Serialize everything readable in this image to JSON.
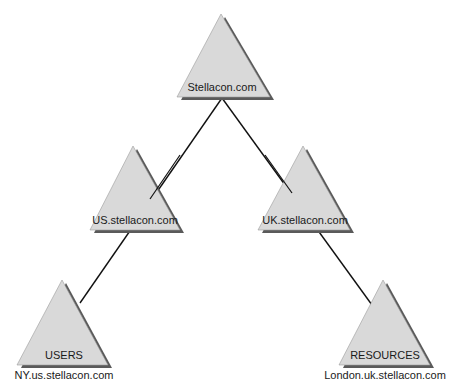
{
  "diagram": {
    "type": "domain-tree",
    "colors": {
      "triangle_fill": "#d9d9d9",
      "shadow": "#5a5a5a",
      "line": "#111111"
    },
    "nodes": [
      {
        "id": "root",
        "label": "Stellacon.com"
      },
      {
        "id": "us",
        "label": "US.stellacon.com"
      },
      {
        "id": "uk",
        "label": "UK.stellacon.com"
      },
      {
        "id": "ny",
        "label": "USERS",
        "caption": "NY.us.stellacon.com"
      },
      {
        "id": "london",
        "label": "RESOURCES",
        "caption": "London.uk.stellacon.com"
      }
    ],
    "edges": [
      {
        "from": "root",
        "to": "us"
      },
      {
        "from": "root",
        "to": "uk"
      },
      {
        "from": "us",
        "to": "ny"
      },
      {
        "from": "uk",
        "to": "london"
      }
    ]
  }
}
